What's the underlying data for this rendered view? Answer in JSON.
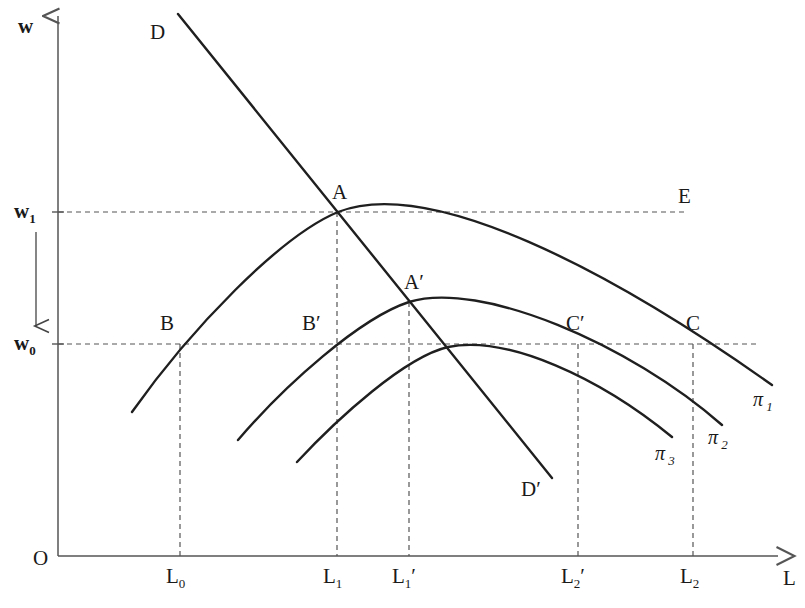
{
  "figure": {
    "type": "economics-diagram",
    "axes": {
      "y_axis_label": "w",
      "x_axis_label": "L",
      "origin_label": "O",
      "y_ticks": [
        {
          "id": "w1",
          "base": "w",
          "sub": "1",
          "y_px": 212
        },
        {
          "id": "w0",
          "base": "w",
          "sub": "0",
          "y_px": 344
        }
      ],
      "x_ticks": [
        {
          "id": "L0",
          "base": "L",
          "sub": "0",
          "prime": "",
          "x_px": 180
        },
        {
          "id": "L1",
          "base": "L",
          "sub": "1",
          "prime": "",
          "x_px": 337
        },
        {
          "id": "L1p",
          "base": "L",
          "sub": "1",
          "prime": "′",
          "x_px": 409
        },
        {
          "id": "L2p",
          "base": "L",
          "sub": "2",
          "prime": "′",
          "x_px": 578
        },
        {
          "id": "L2",
          "base": "L",
          "sub": "2",
          "prime": "",
          "x_px": 693
        }
      ]
    },
    "curves": [
      {
        "id": "demand",
        "start_label": "D",
        "end_label": "D′",
        "kind": "line",
        "note": "downward sloping labour demand"
      },
      {
        "id": "pi1",
        "label_base": "π",
        "label_sub": "1",
        "kind": "isoprofit",
        "peak_point": "A"
      },
      {
        "id": "pi2",
        "label_base": "π",
        "label_sub": "2",
        "kind": "isoprofit",
        "peak_point": "A′"
      },
      {
        "id": "pi3",
        "label_base": "π",
        "label_sub": "3",
        "kind": "isoprofit",
        "peak_point": ""
      }
    ],
    "points": [
      {
        "id": "A",
        "label": "A",
        "x_px": 338,
        "y_px": 212,
        "lx": 332,
        "ly": 182
      },
      {
        "id": "E",
        "label": "E",
        "x_px": 688,
        "y_px": 212,
        "lx": 678,
        "ly": 186
      },
      {
        "id": "Ap",
        "label": "A′",
        "x_px": 409,
        "y_px": 302,
        "lx": 404,
        "ly": 272
      },
      {
        "id": "B",
        "label": "B",
        "x_px": 180,
        "y_px": 344,
        "lx": 160,
        "ly": 313
      },
      {
        "id": "Bp",
        "label": "B′",
        "x_px": 337,
        "y_px": 344,
        "lx": 302,
        "ly": 313
      },
      {
        "id": "Cp",
        "label": "C′",
        "x_px": 578,
        "y_px": 344,
        "lx": 566,
        "ly": 313
      },
      {
        "id": "C",
        "label": "C",
        "x_px": 693,
        "y_px": 344,
        "lx": 686,
        "ly": 313
      }
    ],
    "stroke_color": "#1f1f1f",
    "dash_color": "#555555",
    "axis_color": "#555555"
  }
}
